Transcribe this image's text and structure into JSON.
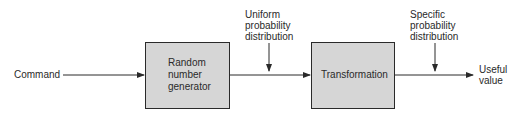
{
  "diagram": {
    "input_label": "Command",
    "blocks": [
      {
        "id": "rng",
        "lines": [
          "Random",
          "number",
          "generator"
        ]
      },
      {
        "id": "transform",
        "lines": [
          "Transformation"
        ]
      }
    ],
    "annotations": [
      {
        "id": "uniform",
        "lines": [
          "Uniform",
          "probability",
          "distribution"
        ]
      },
      {
        "id": "specific",
        "lines": [
          "Specific",
          "probability",
          "distribution"
        ]
      }
    ],
    "output_label": [
      "Useful",
      "value"
    ],
    "colors": {
      "block_fill": "#d6d6d6",
      "stroke": "#2a2a2a"
    }
  }
}
